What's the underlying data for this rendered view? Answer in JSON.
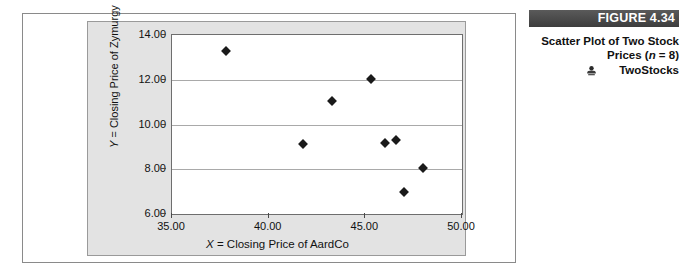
{
  "caption": {
    "figure_banner": "FIGURE 4.34",
    "title_line1": "Scatter Plot of Two Stock",
    "title_line2_prefix": "Prices (",
    "title_line2_italic": "n",
    "title_line2_suffix": " = 8)",
    "dataset_icon": "dataset-file-icon",
    "dataset_label": "TwoStocks",
    "banner_color": "#4f4f4f",
    "banner_text_color": "#ffffff"
  },
  "chart_data": {
    "type": "scatter",
    "title": "",
    "xlabel_italic": "X",
    "xlabel_rest": " = Closing Price of AardCo",
    "ylabel_italic": "Y",
    "ylabel_rest": " = Closing Price of Zymurgy",
    "xlim": [
      35.0,
      50.0
    ],
    "ylim": [
      6.0,
      14.0
    ],
    "xticks": [
      "35.00",
      "40.00",
      "45.00",
      "50.00"
    ],
    "xtick_values": [
      35.0,
      40.0,
      45.0,
      50.0
    ],
    "yticks": [
      "14.00",
      "12.00",
      "10.00",
      "8.00",
      "6.00"
    ],
    "ytick_values": [
      14.0,
      12.0,
      10.0,
      8.0,
      6.0
    ],
    "grid": "horizontal",
    "legend": "none",
    "marker": "diamond",
    "marker_color": "#1a1a1a",
    "plot_bg": "#ffffff",
    "chart_bg": "#e3e3e3",
    "n": 8,
    "series": [
      {
        "name": "TwoStocks",
        "x": [
          37.8,
          41.8,
          43.3,
          45.3,
          46.0,
          46.6,
          47.0,
          48.0
        ],
        "y": [
          13.27,
          9.12,
          11.04,
          12.05,
          9.16,
          9.29,
          6.99,
          8.04
        ]
      }
    ]
  }
}
